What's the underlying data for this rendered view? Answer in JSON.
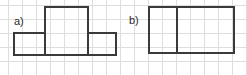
{
  "canvas": {
    "width": 247,
    "height": 75,
    "background_color": "#ffffff",
    "grid": {
      "visible": true,
      "spacing_px": 14,
      "color": "#dedede",
      "vertical_positions": [
        8,
        22,
        36,
        50,
        64,
        78,
        92,
        106,
        120,
        134,
        148,
        162,
        176,
        190,
        204,
        218,
        232,
        246
      ],
      "horizontal_positions": [
        5,
        19,
        33,
        47,
        61
      ]
    },
    "stroke_color": "#3a3a3a",
    "stroke_width": 2
  },
  "figures": [
    {
      "id": "a",
      "label": "a)",
      "label_x": 14,
      "label_y": 16,
      "description": "T-shaped polyomino: one unit square on top centered over a three-unit-wide horizontal row",
      "cell_size_px": 22,
      "bounds": {
        "left": 13,
        "top": 6,
        "right": 116,
        "bottom": 55
      },
      "cells": [
        {
          "col": 1,
          "row": 0
        },
        {
          "col": 0,
          "row": 1
        },
        {
          "col": 1,
          "row": 1
        },
        {
          "col": 2,
          "row": 1
        }
      ],
      "segments": [
        {
          "kind": "h",
          "x": 44,
          "y": 6,
          "length": 45,
          "name": "top-edge-upper-square"
        },
        {
          "kind": "v",
          "x": 44,
          "y": 6,
          "length": 28,
          "name": "left-edge-upper-square"
        },
        {
          "kind": "v",
          "x": 87,
          "y": 6,
          "length": 28,
          "name": "right-edge-upper-square"
        },
        {
          "kind": "h",
          "x": 13,
          "y": 32,
          "length": 32,
          "name": "top-edge-bottom-left-cell"
        },
        {
          "kind": "h",
          "x": 87,
          "y": 32,
          "length": 30,
          "name": "top-edge-bottom-right-cell"
        },
        {
          "kind": "h",
          "x": 13,
          "y": 54,
          "length": 104,
          "name": "bottom-edge-row"
        },
        {
          "kind": "v",
          "x": 13,
          "y": 32,
          "length": 23,
          "name": "left-edge-row"
        },
        {
          "kind": "v",
          "x": 115,
          "y": 32,
          "length": 23,
          "name": "right-edge-row"
        },
        {
          "kind": "v",
          "x": 44,
          "y": 32,
          "length": 23,
          "name": "divider-left"
        },
        {
          "kind": "v",
          "x": 87,
          "y": 32,
          "length": 23,
          "name": "divider-right"
        }
      ]
    },
    {
      "id": "b",
      "label": "b)",
      "label_x": 129,
      "label_y": 15,
      "description": "Horizontal domino: 2x1 rectangle split by a single vertical divider",
      "cell_size_px": 29,
      "bounds": {
        "left": 148,
        "top": 6,
        "right": 234,
        "bottom": 53
      },
      "cells": [
        {
          "col": 0,
          "row": 0
        },
        {
          "col": 1,
          "row": 0
        }
      ],
      "segments": [
        {
          "kind": "h",
          "x": 148,
          "y": 6,
          "length": 87,
          "name": "top-edge"
        },
        {
          "kind": "h",
          "x": 148,
          "y": 52,
          "length": 87,
          "name": "bottom-edge"
        },
        {
          "kind": "v",
          "x": 148,
          "y": 6,
          "length": 47,
          "name": "left-edge"
        },
        {
          "kind": "v",
          "x": 233,
          "y": 6,
          "length": 47,
          "name": "right-edge"
        },
        {
          "kind": "v",
          "x": 176,
          "y": 6,
          "length": 47,
          "name": "divider"
        }
      ]
    }
  ]
}
